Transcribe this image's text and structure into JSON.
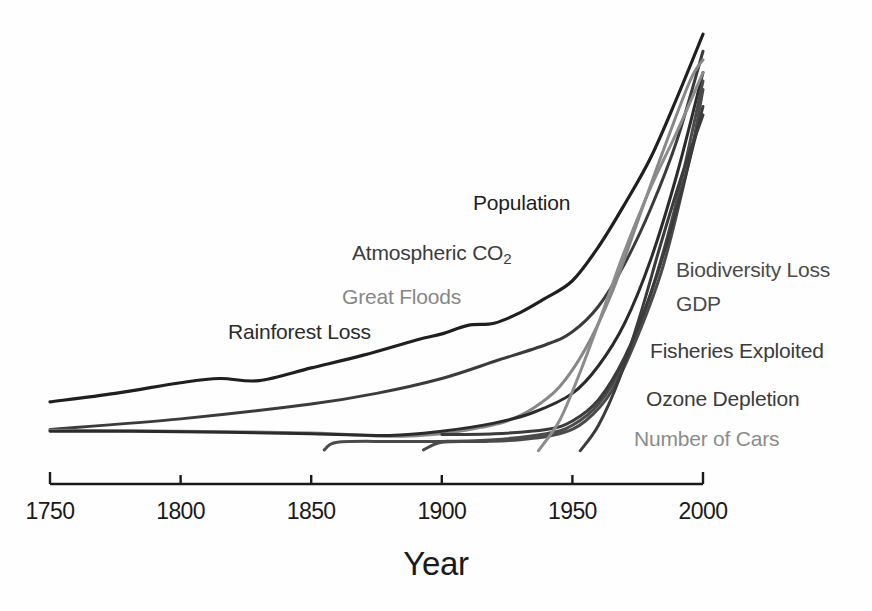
{
  "chart_data": {
    "type": "line",
    "title": "",
    "subtitle": "",
    "xlabel": "Year",
    "ylabel": "",
    "xlim": [
      1750,
      2000
    ],
    "ylim": [
      0,
      100
    ],
    "grid": false,
    "legend_position": "inline-labels",
    "xticks": [
      1750,
      1800,
      1850,
      1900,
      1950,
      2000
    ],
    "xtick_labels": [
      "1750",
      "1800",
      "1850",
      "1900",
      "1950",
      "2000"
    ],
    "yticks": [],
    "ytick_labels": [],
    "annotations": [
      {
        "text": "Population",
        "x": 1905,
        "y": 64,
        "color": "#1f1f1f"
      },
      {
        "text": "Atmospheric CO2",
        "x": 1880,
        "y": 53,
        "color": "#3b3b3b"
      },
      {
        "text": "Great Floods",
        "x": 1865,
        "y": 45,
        "color": "#878787"
      },
      {
        "text": "Rainforest Loss",
        "x": 1828,
        "y": 39,
        "color": "#2b2b2b"
      },
      {
        "text": "Biodiversity Loss",
        "x": 1995,
        "y": 49,
        "color": "#4a4a4a"
      },
      {
        "text": "GDP",
        "x": 1995,
        "y": 43,
        "color": "#4a4a4a"
      },
      {
        "text": "Fisheries Exploited",
        "x": 1995,
        "y": 35,
        "color": "#3b3b3b"
      },
      {
        "text": "Ozone Depletion",
        "x": 1995,
        "y": 26,
        "color": "#3b3b3b"
      },
      {
        "text": "Number of Cars",
        "x": 1995,
        "y": 19,
        "color": "#8c8c8c"
      }
    ],
    "series": [
      {
        "name": "Population",
        "color": "#1f1f1f",
        "width": 3.2,
        "x": [
          1750,
          1775,
          1800,
          1815,
          1830,
          1850,
          1870,
          1890,
          1900,
          1910,
          1920,
          1930,
          1940,
          1950,
          1960,
          1970,
          1980,
          1990,
          2000
        ],
        "y": [
          12.5,
          14.5,
          17.0,
          18.0,
          17.5,
          20.5,
          23.5,
          27.0,
          28.5,
          30.5,
          31.0,
          33.5,
          37.0,
          41.0,
          49.0,
          59.0,
          70.0,
          84.0,
          99.0
        ]
      },
      {
        "name": "Atmospheric CO2",
        "color": "#3b3b3b",
        "width": 3.0,
        "x": [
          1750,
          1800,
          1850,
          1875,
          1900,
          1920,
          1940,
          1950,
          1960,
          1970,
          1980,
          1990,
          2000
        ],
        "y": [
          6.0,
          8.5,
          12.0,
          14.5,
          18.0,
          22.0,
          26.0,
          29.0,
          35.0,
          45.0,
          58.0,
          74.0,
          95.0
        ]
      },
      {
        "name": "Great Floods",
        "color": "#878787",
        "width": 3.0,
        "x": [
          1750,
          1800,
          1850,
          1880,
          1900,
          1915,
          1925,
          1935,
          1945,
          1955,
          1965,
          1975,
          1985,
          1995,
          2000
        ],
        "y": [
          5.8,
          5.6,
          5.2,
          4.4,
          5.0,
          6.5,
          8.0,
          11.0,
          16.0,
          25.0,
          38.0,
          55.0,
          72.0,
          88.0,
          93.0
        ]
      },
      {
        "name": "Rainforest Loss",
        "color": "#2b2b2b",
        "width": 3.0,
        "x": [
          1750,
          1800,
          1850,
          1880,
          1900,
          1920,
          1935,
          1950,
          1960,
          1970,
          1980,
          1990,
          2000
        ],
        "y": [
          5.6,
          5.5,
          5.0,
          4.6,
          5.6,
          7.5,
          10.0,
          14.5,
          21.0,
          31.0,
          46.0,
          66.0,
          90.0
        ]
      },
      {
        "name": "Biodiversity Loss",
        "color": "#4a4a4a",
        "width": 3.0,
        "x": [
          1855,
          1860,
          1880,
          1900,
          1920,
          1940,
          1950,
          1960,
          1970,
          1980,
          1990,
          2000
        ],
        "y": [
          1.2,
          3.0,
          3.2,
          3.2,
          3.6,
          5.0,
          7.0,
          12.0,
          22.0,
          38.0,
          60.0,
          88.0
        ]
      },
      {
        "name": "GDP",
        "color": "#4a4a4a",
        "width": 3.0,
        "x": [
          1893,
          1900,
          1915,
          1930,
          1945,
          1955,
          1965,
          1975,
          1985,
          1995,
          2000
        ],
        "y": [
          1.2,
          3.0,
          3.2,
          3.6,
          5.0,
          8.0,
          15.0,
          28.0,
          45.0,
          70.0,
          86.0
        ]
      },
      {
        "name": "Fisheries Exploited",
        "color": "#3b3b3b",
        "width": 3.0,
        "x": [
          1900,
          1920,
          1940,
          1950,
          1960,
          1970,
          1980,
          1990,
          2000
        ],
        "y": [
          4.8,
          5.0,
          6.0,
          8.0,
          13.0,
          23.0,
          38.0,
          58.0,
          82.0
        ]
      },
      {
        "name": "Ozone Depletion",
        "color": "#3b3b3b",
        "width": 3.0,
        "x": [
          1953,
          1960,
          1968,
          1976,
          1984,
          1992,
          2000
        ],
        "y": [
          1.0,
          7.0,
          18.0,
          33.0,
          50.0,
          66.0,
          80.0
        ]
      },
      {
        "name": "Number of Cars",
        "color": "#8c8c8c",
        "width": 3.0,
        "x": [
          1937,
          1945,
          1952,
          1960,
          1970,
          1980,
          1990,
          2000
        ],
        "y": [
          1.0,
          8.0,
          18.0,
          31.0,
          48.0,
          63.0,
          76.0,
          90.0
        ]
      }
    ]
  },
  "axis": {
    "line_color": "#1a1a1a",
    "title": "Year"
  }
}
